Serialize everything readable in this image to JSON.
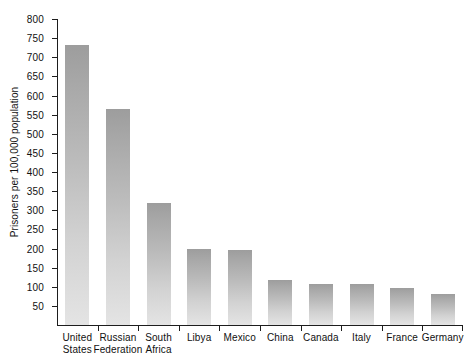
{
  "chart_data": {
    "type": "bar",
    "title": "",
    "subtitle": "",
    "xlabel": "",
    "ylabel": "Prisoners per 100,000 population",
    "ylim": [
      0,
      800
    ],
    "ytick_step": 50,
    "yticks": [
      50,
      100,
      150,
      200,
      250,
      300,
      350,
      400,
      450,
      500,
      550,
      600,
      650,
      700,
      750,
      800
    ],
    "ytick_labels": [
      "50",
      "100",
      "150",
      "200",
      "250",
      "300",
      "350",
      "400",
      "450",
      "500",
      "550",
      "600",
      "650",
      "700",
      "750",
      "800"
    ],
    "grid": false,
    "legend": false,
    "legend_position": "none",
    "categories": [
      "United States",
      "Russian Federation",
      "South Africa",
      "Libya",
      "Mexico",
      "China",
      "Canada",
      "Italy",
      "France",
      "Germany"
    ],
    "category_lines": [
      [
        "United",
        "States"
      ],
      [
        "Russian",
        "Federation"
      ],
      [
        "South",
        "Africa"
      ],
      [
        "Libya",
        ""
      ],
      [
        "Mexico",
        ""
      ],
      [
        "China",
        ""
      ],
      [
        "Canada",
        ""
      ],
      [
        "Italy",
        ""
      ],
      [
        "France",
        ""
      ],
      [
        "Germany",
        ""
      ]
    ],
    "values": [
      732,
      564,
      318,
      200,
      197,
      118,
      108,
      108,
      97,
      81
    ],
    "bar_color_top": "#9d9d9d",
    "bar_color_bottom": "#e4e4e4",
    "axis_color": "#1d1d1d",
    "background": "#ffffff"
  }
}
